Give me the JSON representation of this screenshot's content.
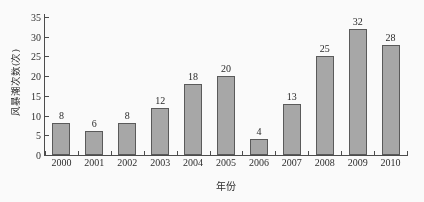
{
  "chart_data": {
    "type": "bar",
    "title": "",
    "subtitle": "",
    "xlabel": "年份",
    "ylabel": "风暴潮次数(次)",
    "categories": [
      "2000",
      "2001",
      "2002",
      "2003",
      "2004",
      "2005",
      "2006",
      "2007",
      "2008",
      "2009",
      "2010"
    ],
    "values": [
      8,
      6,
      8,
      12,
      18,
      20,
      4,
      13,
      25,
      32,
      28
    ],
    "value_labels": [
      "8",
      "6",
      "8",
      "12",
      "18",
      "20",
      "4",
      "13",
      "25",
      "32",
      "28"
    ],
    "ylim": [
      0,
      35
    ],
    "ytick_step": 5,
    "ytick_labels": [
      "0",
      "5",
      "10",
      "15",
      "20",
      "25",
      "30",
      "35"
    ],
    "ytick_values": [
      0,
      5,
      10,
      15,
      20,
      25,
      30,
      35
    ],
    "grid": false,
    "legend": false,
    "legend_position": "none",
    "bar_fill": "#a9a9a9",
    "bar_border": "#585858",
    "axis_color": "#4a4a4a",
    "text_color": "#2b2b2b",
    "tick_direction": "in",
    "annotations": "Each bar is labeled above with its value."
  }
}
